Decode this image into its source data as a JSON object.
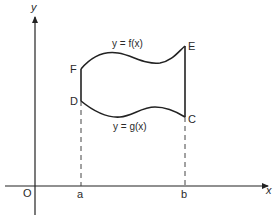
{
  "diagram": {
    "axes": {
      "x_label": "x",
      "y_label": "y",
      "origin_label": "O"
    },
    "ticks": {
      "a": "a",
      "b": "b"
    },
    "points": {
      "F": "F",
      "D": "D",
      "E": "E",
      "C": "C"
    },
    "curves": {
      "upper": "y = f(x)",
      "lower": "y = g(x)"
    },
    "colors": {
      "stroke": "#222222",
      "dashed": "#444444",
      "text": "#2a2a2a"
    }
  }
}
